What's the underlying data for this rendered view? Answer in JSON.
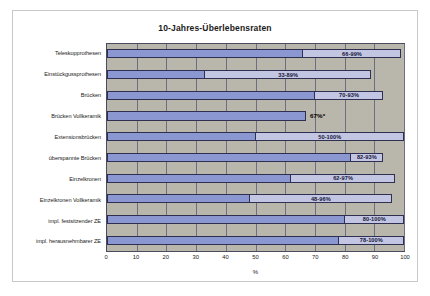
{
  "chart_data": {
    "type": "bar",
    "orientation": "horizontal",
    "title": "10-Jahres-Überlebensraten",
    "xlabel": "%",
    "ylabel": "",
    "xlim": [
      0,
      100
    ],
    "xticks": [
      0,
      10,
      20,
      30,
      40,
      50,
      60,
      70,
      80,
      90,
      100
    ],
    "grid": true,
    "legend": "none",
    "plot_background": "#b9b6ab",
    "colors": {
      "low_bar": "#8b97d0",
      "high_bar": "#c3c6e2",
      "border": "#2f2f52",
      "grid": "#6e6e82"
    },
    "categories": [
      "Teleskopprothesen",
      "Einstückgussprothesen",
      "Brücken",
      "Brücken Vollkeramik",
      "Extensionsbrücken",
      "überspannte Brücken",
      "Einzelkronen",
      "Einzelkronen Vollkeramik",
      "impl. festsitzender ZE",
      "impl. herausnehmbarer ZE"
    ],
    "series": [
      {
        "name": "untere Grenze",
        "values": [
          66,
          33,
          70,
          67,
          50,
          82,
          62,
          48,
          80,
          78
        ]
      },
      {
        "name": "obere Grenze",
        "values": [
          99,
          89,
          93,
          67,
          100,
          93,
          97,
          96,
          100,
          100
        ]
      }
    ],
    "bars": [
      {
        "category": "Teleskopprothesen",
        "low": 66,
        "high": 99,
        "label": "66-99%",
        "label_outside": false
      },
      {
        "category": "Einstückgussprothesen",
        "low": 33,
        "high": 89,
        "label": "33-89%",
        "label_outside": false
      },
      {
        "category": "Brücken",
        "low": 70,
        "high": 93,
        "label": "70-93%",
        "label_outside": false
      },
      {
        "category": "Brücken Vollkeramik",
        "low": 67,
        "high": 67,
        "label": "67%*",
        "label_outside": true
      },
      {
        "category": "Extensionsbrücken",
        "low": 50,
        "high": 100,
        "label": "50-100%",
        "label_outside": false
      },
      {
        "category": "überspannte Brücken",
        "low": 82,
        "high": 93,
        "label": "82-93%",
        "label_outside": false
      },
      {
        "category": "Einzelkronen",
        "low": 62,
        "high": 97,
        "label": "62-97%",
        "label_outside": false
      },
      {
        "category": "Einzelkronen Vollkeramik",
        "low": 48,
        "high": 96,
        "label": "48-96%",
        "label_outside": false
      },
      {
        "category": "impl. festsitzender ZE",
        "low": 80,
        "high": 100,
        "label": "80-100%",
        "label_outside": false
      },
      {
        "category": "impl. herausnehmbarer ZE",
        "low": 78,
        "high": 100,
        "label": "78-100%",
        "label_outside": false
      }
    ]
  }
}
